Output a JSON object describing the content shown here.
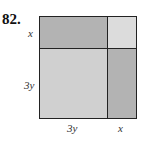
{
  "problem": {
    "number": "82."
  },
  "diagram": {
    "labels": {
      "left_top": "x",
      "left_bottom": "3y",
      "bottom_left": "3y",
      "bottom_right": "x"
    },
    "colors": {
      "top_left": "#b3b3b3",
      "top_right": "#dcdcdc",
      "bottom_left": "#d0d0d0",
      "bottom_right": "#b3b3b3",
      "border": "#222222"
    },
    "regions": [
      {
        "id": "top-left",
        "dims": "3y by x"
      },
      {
        "id": "top-right",
        "dims": "x by x"
      },
      {
        "id": "bottom-left",
        "dims": "3y by 3y"
      },
      {
        "id": "bottom-right",
        "dims": "x by 3y"
      }
    ]
  }
}
